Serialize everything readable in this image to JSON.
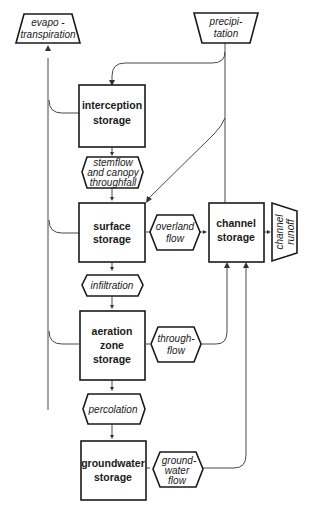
{
  "diagram": {
    "type": "hydrological-cycle-flowchart",
    "inputs": {
      "precipitation": [
        "precipi-",
        "tation"
      ]
    },
    "outputs": {
      "evapotranspiration": [
        "evapo -",
        "transpiration"
      ],
      "channel_runoff": [
        "channel",
        "runoff"
      ]
    },
    "storages": {
      "interception": [
        "interception",
        "storage"
      ],
      "surface": [
        "surface",
        "storage"
      ],
      "aeration_zone": [
        "aeration",
        "zone",
        "storage"
      ],
      "groundwater": [
        "groundwater",
        "storage"
      ],
      "channel": [
        "channel",
        "storage"
      ]
    },
    "flows": {
      "stemflow": [
        "stemflow",
        "and canopy",
        "throughfall"
      ],
      "infiltration": [
        "infiltration"
      ],
      "percolation": [
        "percolation"
      ],
      "overland_flow": [
        "overland",
        "flow"
      ],
      "throughflow": [
        "through-",
        "flow"
      ],
      "groundwater_flow": [
        "ground-",
        "water",
        "flow"
      ]
    },
    "colors": {
      "stroke": "#1a1a1a",
      "background": "#ffffff"
    }
  }
}
